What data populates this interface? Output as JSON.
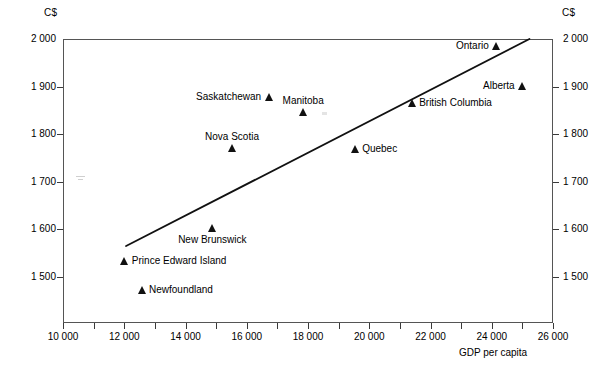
{
  "chart_data": {
    "type": "scatter",
    "title": "",
    "xlabel": "GDP per capita",
    "ylabel": "",
    "unit_left": "C$",
    "unit_right": "C$",
    "xlim": [
      10000,
      26000
    ],
    "ylim": [
      1430,
      2000
    ],
    "xticks_major": [
      "10 000",
      "12 000",
      "14 000",
      "16 000",
      "18 000",
      "20 000",
      "22 000",
      "24 000",
      "26 000"
    ],
    "xticks_major_values": [
      10000,
      12000,
      14000,
      16000,
      18000,
      20000,
      22000,
      24000,
      26000
    ],
    "xticks_minor_values": [
      11000,
      13000,
      15000,
      17000,
      19000,
      21000,
      23000,
      25000
    ],
    "yticks": [
      "2 000",
      "1 900",
      "1 800",
      "1 700",
      "1 600",
      "1 500"
    ],
    "ytick_values": [
      2000,
      1900,
      1800,
      1700,
      1600,
      1500
    ],
    "grid": false,
    "legend": "none",
    "marker_shape": "triangle",
    "points": [
      {
        "label": "Ontario",
        "x": 24170,
        "y": 1985,
        "label_side": "left",
        "label_dy": 0
      },
      {
        "label": "Alberta",
        "x": 25020,
        "y": 1901,
        "label_side": "left",
        "label_dy": 0
      },
      {
        "label": "British Columbia",
        "x": 21400,
        "y": 1865,
        "label_side": "right",
        "label_dy": 0
      },
      {
        "label": "Saskatchewan",
        "x": 16730,
        "y": 1878,
        "label_side": "left",
        "label_dy": 0
      },
      {
        "label": "Manitoba",
        "x": 17840,
        "y": 1847,
        "label_side": "above",
        "label_dy": 0
      },
      {
        "label": "Nova Scotia",
        "x": 15520,
        "y": 1770,
        "label_side": "above",
        "label_dy": 0
      },
      {
        "label": "Quebec",
        "x": 19540,
        "y": 1768,
        "label_side": "right",
        "label_dy": 0
      },
      {
        "label": "New Brunswick",
        "x": 14870,
        "y": 1603,
        "label_side": "below",
        "label_dy": 0
      },
      {
        "label": "Prince Edward Island",
        "x": 12020,
        "y": 1533,
        "label_side": "right",
        "label_dy": 0
      },
      {
        "label": "Newfoundland",
        "x": 12580,
        "y": 1472,
        "label_side": "right",
        "label_dy": 0
      }
    ],
    "trendline": {
      "name": "regression-line",
      "x_start": 12060,
      "y_start": 1565,
      "x_end": 25230,
      "y_end": 2000
    },
    "colors": {
      "marker": "#111111",
      "line": "#111111",
      "frame": "#555555",
      "text": "#000000"
    }
  }
}
